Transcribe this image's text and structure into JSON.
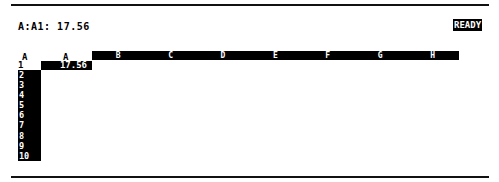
{
  "status": {
    "cell_reference": "A:A1: 17.56",
    "mode": "READY"
  },
  "grid": {
    "corner_label": "A",
    "columns": [
      "A",
      "B",
      "C",
      "D",
      "E",
      "F",
      "G",
      "H"
    ],
    "rows": [
      "1",
      "2",
      "3",
      "4",
      "5",
      "6",
      "7",
      "8",
      "9",
      "10"
    ],
    "cells": {
      "A1": "17.56"
    },
    "selected_cell": "A1"
  },
  "colors": {
    "background": "#ffffff",
    "foreground": "#000000",
    "highlight": "#000000"
  }
}
